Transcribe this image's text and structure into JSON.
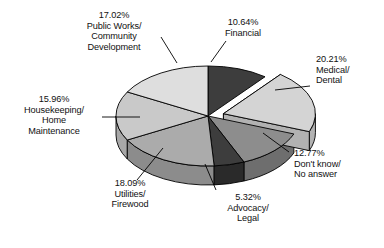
{
  "chart_data": {
    "type": "pie",
    "title": "",
    "subtitle": "",
    "xlabel": "",
    "ylabel": "",
    "legend_position": "none",
    "grid": false,
    "three_d": true,
    "exploded_slices": [
      "Medical/Dental"
    ],
    "units": "percent",
    "categories": [
      "Financial",
      "Medical/Dental",
      "Don't know/No answer",
      "Advocacy/Legal",
      "Utilities/Firewood",
      "Housekeeping/Home Maintenance",
      "Public Works/Community Development"
    ],
    "values": [
      10.64,
      20.21,
      12.77,
      5.32,
      18.09,
      15.96,
      17.02
    ],
    "slices": [
      {
        "label": "Financial",
        "value": 10.64,
        "percent_text": "10.64%",
        "color": "#3d3d3d",
        "side_color": "#2a2a2a"
      },
      {
        "label": "Medical/Dental",
        "value": 20.21,
        "percent_text": "20.21%",
        "color": "#d4d4d4",
        "side_color": "#b2b2b2"
      },
      {
        "label": "Don't know/No answer",
        "value": 12.77,
        "percent_text": "12.77%",
        "color": "#8d8d8d",
        "side_color": "#6e6e6e"
      },
      {
        "label": "Advocacy/Legal",
        "value": 5.32,
        "percent_text": "5.32%",
        "color": "#3d3d3d",
        "side_color": "#2a2a2a"
      },
      {
        "label": "Utilities/Firewood",
        "value": 18.09,
        "percent_text": "18.09%",
        "color": "#ababab",
        "side_color": "#8c8c8c"
      },
      {
        "label": "Housekeeping/Home Maintenance",
        "value": 15.96,
        "percent_text": "15.96%",
        "color": "#c9c9c9",
        "side_color": "#a8a8a8"
      },
      {
        "label": "Public Works/Community Development",
        "value": 17.02,
        "percent_text": "17.02%",
        "color": "#dedede",
        "side_color": "#bdbdbd"
      }
    ]
  },
  "labels": {
    "public_works": "17.02%\nPublic Works/\nCommunity\nDevelopment",
    "financial": "10.64%\nFinancial",
    "medical": "20.21%\nMedical/\nDental",
    "dont_know": "12.77%\nDon't know/\nNo answer",
    "advocacy": "5.32%\nAdvocacy/\nLegal",
    "utilities": "18.09%\nUtilities/\nFirewood",
    "housekeeping": "15.96%\nHousekeeping/\nHome\nMaintenance"
  },
  "colors": {
    "background": "#ffffff",
    "outline": "#000000",
    "leader_line": "#000000",
    "text": "#111111"
  }
}
